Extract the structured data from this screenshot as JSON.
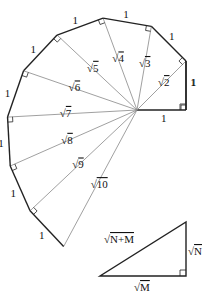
{
  "unit_label": "1",
  "hypotenuses": [
    "2",
    "3",
    "4",
    "5",
    "6",
    "7",
    "8",
    "9",
    "10"
  ],
  "triangle": {
    "hypotenuse": "N+M",
    "vertical_leg": "N",
    "horizontal_leg": "M"
  },
  "colors": {
    "outline": "#222222",
    "radial": "#888888"
  }
}
